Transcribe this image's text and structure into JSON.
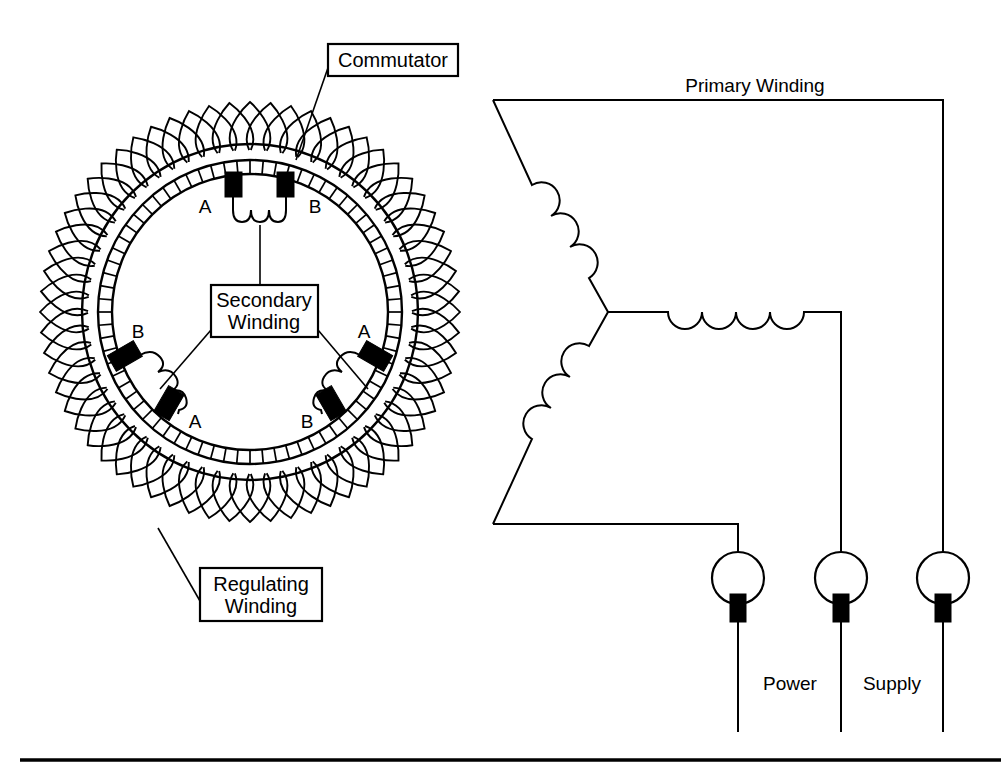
{
  "diagram": {
    "background_color": "#ffffff",
    "line_color": "#000000",
    "labels": {
      "commutator": "Commutator",
      "secondary_winding_line1": "Secondary",
      "secondary_winding_line2": "Winding",
      "regulating_winding_line1": "Regulating",
      "regulating_winding_line2": "Winding",
      "primary_winding": "Primary Winding",
      "power": "Power",
      "supply": "Supply"
    },
    "brush_letters": {
      "top_left": "A",
      "top_right": "B",
      "lower_left_upper": "B",
      "lower_left_lower": "A",
      "lower_right_upper": "A",
      "lower_right_lower": "B"
    },
    "rotor": {
      "center_x": 250,
      "center_y": 312,
      "band_outer_radius": 168,
      "band_inner_radius": 152,
      "commutator_outer_radius": 152,
      "commutator_inner_radius": 138,
      "commutator_segment_count": 72,
      "regulating_loop_count": 64,
      "regulating_loop_length": 42
    },
    "brush_pairs": [
      {
        "name": "top-pair",
        "angle_a": -104,
        "angle_b": -76,
        "letters": [
          "A",
          "B"
        ]
      },
      {
        "name": "lower-left-pair",
        "angle_a": 150,
        "angle_b": 119,
        "letters": [
          "B",
          "A"
        ]
      },
      {
        "name": "lower-right-pair",
        "angle_a": 30,
        "angle_b": 61,
        "letters": [
          "A",
          "B"
        ]
      }
    ],
    "circuit": {
      "winding_arms": 3,
      "coil_bumps_per_arm": 4,
      "terminals": [
        {
          "name": "terminal-left",
          "cx": 738,
          "cy": 578,
          "r": 26
        },
        {
          "name": "terminal-middle",
          "cx": 841,
          "cy": 578,
          "r": 26
        },
        {
          "name": "terminal-right",
          "cx": 943,
          "cy": 578,
          "r": 26
        }
      ],
      "star_point": {
        "x": 608,
        "y": 312
      }
    },
    "boxes": {
      "commutator": {
        "x": 328,
        "y": 44,
        "w": 130,
        "h": 32
      },
      "secondary": {
        "x": 211,
        "y": 285,
        "w": 107,
        "h": 52
      },
      "regulating": {
        "x": 200,
        "y": 568,
        "w": 122,
        "h": 53
      }
    }
  }
}
